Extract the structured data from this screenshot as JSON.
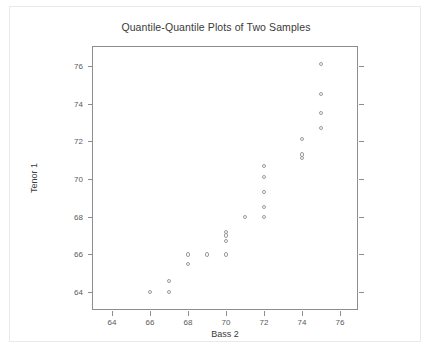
{
  "chart_data": {
    "type": "scatter",
    "title": "Quantile-Quantile Plots of Two Samples",
    "xlabel": "Bass 2",
    "ylabel": "Tenor 1",
    "xlim": [
      63.0,
      77.0
    ],
    "ylim": [
      63.0,
      77.0
    ],
    "grid": false,
    "legend": null,
    "xticks": [
      64,
      66,
      68,
      70,
      72,
      74,
      76
    ],
    "yticks": [
      64,
      66,
      68,
      70,
      72,
      74,
      76
    ],
    "marker": "open-circle",
    "marker_color": "#9a9a9a",
    "points": [
      {
        "x": 66.0,
        "y": 64.0
      },
      {
        "x": 67.0,
        "y": 64.0
      },
      {
        "x": 67.0,
        "y": 64.6
      },
      {
        "x": 68.0,
        "y": 65.5
      },
      {
        "x": 68.0,
        "y": 66.0
      },
      {
        "x": 69.0,
        "y": 66.0
      },
      {
        "x": 70.0,
        "y": 66.0
      },
      {
        "x": 70.0,
        "y": 66.7
      },
      {
        "x": 70.0,
        "y": 67.0
      },
      {
        "x": 70.0,
        "y": 67.2
      },
      {
        "x": 71.0,
        "y": 68.0
      },
      {
        "x": 72.0,
        "y": 68.0
      },
      {
        "x": 72.0,
        "y": 68.5
      },
      {
        "x": 72.0,
        "y": 69.3
      },
      {
        "x": 72.0,
        "y": 70.1
      },
      {
        "x": 72.0,
        "y": 70.7
      },
      {
        "x": 74.0,
        "y": 71.1
      },
      {
        "x": 74.0,
        "y": 71.3
      },
      {
        "x": 74.0,
        "y": 72.1
      },
      {
        "x": 75.0,
        "y": 72.7
      },
      {
        "x": 75.0,
        "y": 73.5
      },
      {
        "x": 75.0,
        "y": 74.5
      },
      {
        "x": 75.0,
        "y": 76.1
      }
    ]
  },
  "colors": {
    "frame": "#8d8d8d",
    "marker": "#9a9a9a",
    "text": "#3a3a3a",
    "tick_text": "#595959",
    "card_border": "#e9e9e9",
    "background": "#ffffff"
  }
}
